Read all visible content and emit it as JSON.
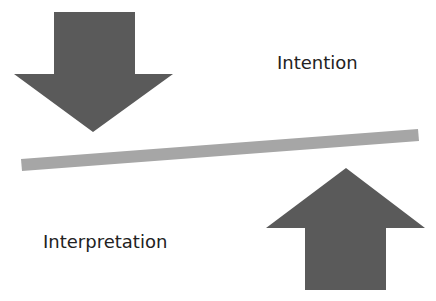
{
  "diagram": {
    "labels": {
      "intention": "Intention",
      "interpretation": "Interpretation"
    },
    "colors": {
      "arrow": "#5a5a5a",
      "bar": "#a6a6a6",
      "text": "#222222",
      "background": "#ffffff"
    },
    "elements": [
      {
        "type": "arrow",
        "direction": "down",
        "position": "top-left"
      },
      {
        "type": "bar",
        "orientation": "slightly tilted, rising to the right",
        "position": "center"
      },
      {
        "type": "arrow",
        "direction": "up",
        "position": "bottom-right"
      }
    ]
  }
}
